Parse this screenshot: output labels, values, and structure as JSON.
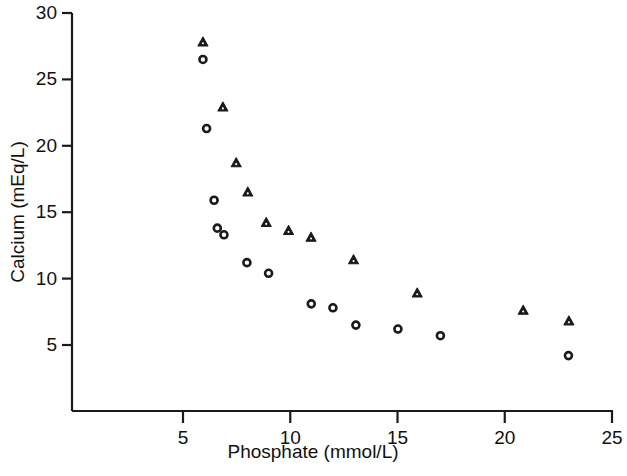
{
  "chart_data": {
    "type": "scatter",
    "title": "",
    "xlabel": "Phosphate (mmol/L)",
    "ylabel": "Calcium (mEq/L)",
    "xlim": [
      2.0,
      25.9
    ],
    "ylim": [
      3.0,
      30.8
    ],
    "xticks": [
      5,
      10,
      15,
      20,
      25
    ],
    "yticks": [
      5,
      10,
      15,
      20,
      25,
      30
    ],
    "xtick_labels": [
      "5",
      "10",
      "15",
      "20",
      "25"
    ],
    "ytick_labels": [
      "5",
      "10",
      "15",
      "20",
      "25",
      "30"
    ],
    "grid": false,
    "legend": null,
    "marker_color": "#1a1a1a",
    "series": [
      {
        "name": "triangle-series",
        "marker": "triangle",
        "points": [
          [
            5.93,
            27.8
          ],
          [
            6.86,
            22.9
          ],
          [
            7.48,
            18.7
          ],
          [
            8.02,
            16.5
          ],
          [
            8.88,
            14.2
          ],
          [
            9.92,
            13.6
          ],
          [
            10.97,
            13.1
          ],
          [
            12.95,
            11.4
          ],
          [
            15.92,
            8.9
          ],
          [
            20.86,
            7.6
          ],
          [
            22.99,
            6.8
          ]
        ]
      },
      {
        "name": "circle-series",
        "marker": "circle",
        "points": [
          [
            5.93,
            26.5
          ],
          [
            6.1,
            21.3
          ],
          [
            6.45,
            15.9
          ],
          [
            6.6,
            13.8
          ],
          [
            6.91,
            13.3
          ],
          [
            7.98,
            11.2
          ],
          [
            8.99,
            10.4
          ],
          [
            10.98,
            8.1
          ],
          [
            11.99,
            7.8
          ],
          [
            13.06,
            6.5
          ],
          [
            15.02,
            6.2
          ],
          [
            17.0,
            5.7
          ],
          [
            22.97,
            4.2
          ]
        ]
      }
    ]
  },
  "axes": {
    "x_axis_name": "x-axis",
    "y_axis_name": "y-axis"
  }
}
